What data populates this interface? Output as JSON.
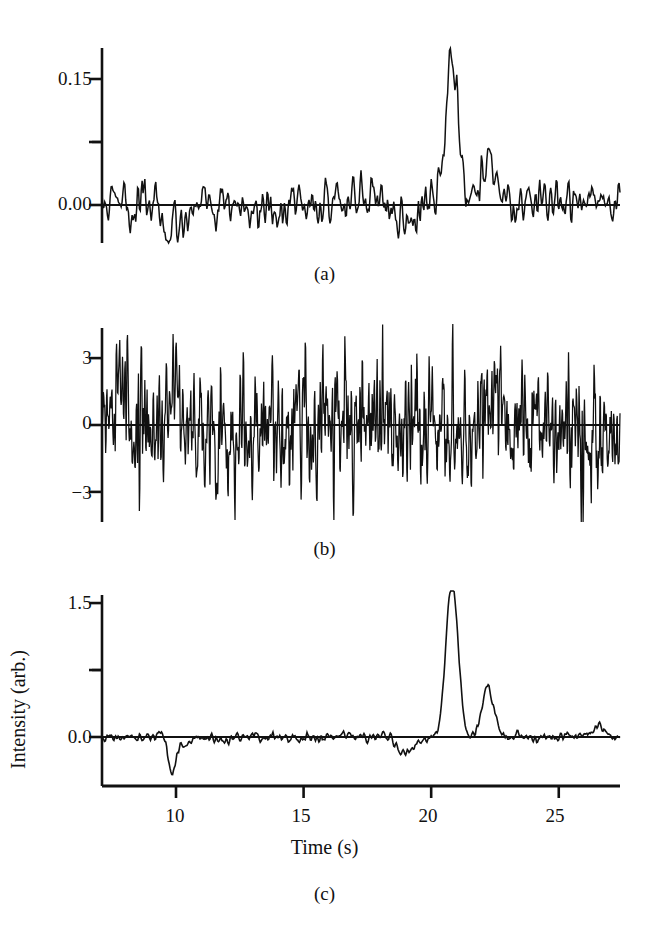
{
  "figure": {
    "background_color": "#ffffff",
    "ink_color": "#111111",
    "axis_title_x": "Time (s)",
    "axis_title_y": "Intensity (arb.)"
  },
  "panels": [
    {
      "id": "a",
      "caption": "(a)",
      "ytick_labels": [
        "0.15",
        "0.00"
      ],
      "xtick_labels": []
    },
    {
      "id": "b",
      "caption": "(b)",
      "ytick_labels": [
        "3",
        "0",
        "−3"
      ],
      "xtick_labels": []
    },
    {
      "id": "c",
      "caption": "(c)",
      "ytick_labels": [
        "1.5",
        "0.0"
      ],
      "xtick_labels": [
        "10",
        "15",
        "20",
        "25"
      ]
    }
  ],
  "chart_data": [
    {
      "type": "line",
      "panel": "a",
      "title": "",
      "xlabel": "",
      "ylabel": "",
      "xlim": [
        7.1,
        27.4
      ],
      "ylim": [
        -0.06,
        0.195
      ],
      "yticks": [
        0.0,
        0.075,
        0.15
      ],
      "ytick_labels": [
        "0.00",
        "",
        "0.15"
      ],
      "minor_ytick_values": [
        0.075
      ],
      "xticks": [],
      "grid": false,
      "legend": null,
      "description": "Noisy correlation/intensity trace with a prominent peak near t = 20.8 s and a smaller secondary peak near t = 22.2 s",
      "series": [
        {
          "name": "noisy_signal_a",
          "baseline": 0.0,
          "noise_amplitude": 0.022,
          "noise_seed": 1771,
          "sample_rate_per_second": 28,
          "features": [
            {
              "center": 20.8,
              "height": 0.175,
              "width": 0.26
            },
            {
              "center": 22.2,
              "height": 0.06,
              "width": 0.28
            },
            {
              "center": 9.8,
              "height": -0.03,
              "width": 0.45
            },
            {
              "center": 19.05,
              "height": -0.016,
              "width": 0.4
            }
          ]
        }
      ]
    },
    {
      "type": "line",
      "panel": "b",
      "title": "",
      "xlabel": "",
      "ylabel": "Intensity (arb.)",
      "xlim": [
        7.1,
        27.4
      ],
      "ylim": [
        -5.0,
        5.0
      ],
      "yticks": [
        -3,
        0,
        3
      ],
      "ytick_labels": [
        "−3",
        "0",
        "3"
      ],
      "xticks": [],
      "grid": false,
      "legend": null,
      "description": "Dense broadband white noise record with no discernible peak; excursions reach approximately ±4.5 arb. units",
      "series": [
        {
          "name": "white_noise_b",
          "baseline": 0.0,
          "noise_amplitude": 2.4,
          "noise_seed": 90210,
          "sample_rate_per_second": 56,
          "features": []
        }
      ]
    },
    {
      "type": "line",
      "panel": "c",
      "title": "",
      "xlabel": "Time (s)",
      "ylabel": "",
      "xlim": [
        7.1,
        27.4
      ],
      "ylim": [
        -0.4,
        1.95
      ],
      "yticks": [
        0.0,
        0.75,
        1.5
      ],
      "ytick_labels": [
        "0.0",
        "",
        "1.5"
      ],
      "minor_ytick_values": [
        0.75
      ],
      "xticks": [
        10,
        15,
        20,
        25
      ],
      "xtick_labels": [
        "10",
        "15",
        "20",
        "25"
      ],
      "grid": false,
      "legend": null,
      "description": "Recovered / denoised signal: low-noise baseline with a tall peak of about 1.7 near t = 20.8 s, a secondary peak of about 0.55 near t = 22.2 s, a deep negative spike of about -0.35 near t = 9.8 s and a shallower dip of about -0.18 near t = 19.0 s",
      "series": [
        {
          "name": "recovered_signal_c",
          "baseline": 0.0,
          "noise_amplitude": 0.045,
          "noise_seed": 4242,
          "sample_rate_per_second": 30,
          "features": [
            {
              "center": 20.82,
              "height": 1.72,
              "width": 0.24
            },
            {
              "center": 22.22,
              "height": 0.55,
              "width": 0.24
            },
            {
              "center": 9.82,
              "height": -0.36,
              "width": 0.12
            },
            {
              "center": 10.15,
              "height": -0.13,
              "width": 0.3
            },
            {
              "center": 19.05,
              "height": -0.18,
              "width": 0.35
            },
            {
              "center": 26.55,
              "height": 0.13,
              "width": 0.18
            }
          ]
        }
      ]
    }
  ]
}
